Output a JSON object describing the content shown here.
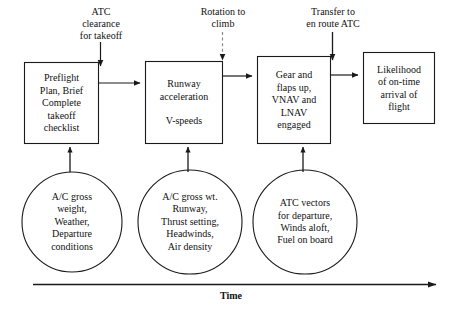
{
  "diagram": {
    "stroke_color": "#1a1a1a",
    "background_color": "#ffffff",
    "process_boxes": [
      {
        "id": "preflight",
        "text": "Preflight\nPlan, Brief\nComplete\ntakeoff\nchecklist"
      },
      {
        "id": "runway",
        "text": "Runway\nacceleration\n\nV-speeds"
      },
      {
        "id": "climbout",
        "text": "Gear and\nflaps up,\nVNAV and\nLNAV\nengaged"
      },
      {
        "id": "outcome",
        "text": "Likelihood\nof on-time\narrival of\nflight"
      }
    ],
    "event_labels": [
      {
        "id": "atc-clearance",
        "text": "ATC\nclearance\nfor takeoff",
        "arrow_style": "solid"
      },
      {
        "id": "rotation",
        "text": "Rotation to\nclimb",
        "arrow_style": "dashed"
      },
      {
        "id": "transfer",
        "text": "Transfer to\nen route ATC",
        "arrow_style": "solid"
      }
    ],
    "input_circles": [
      {
        "id": "preflight-inputs",
        "text": "A/C gross\nweight,\nWeather,\nDeparture\nconditions"
      },
      {
        "id": "runway-inputs",
        "text": "A/C gross wt.\nRunway,\nThrust setting,\nHeadwinds,\nAir density"
      },
      {
        "id": "climbout-inputs",
        "text": "ATC vectors\nfor departure,\nWinds aloft,\nFuel on board"
      }
    ],
    "axis": {
      "label": "Time",
      "direction": "left-to-right"
    }
  }
}
